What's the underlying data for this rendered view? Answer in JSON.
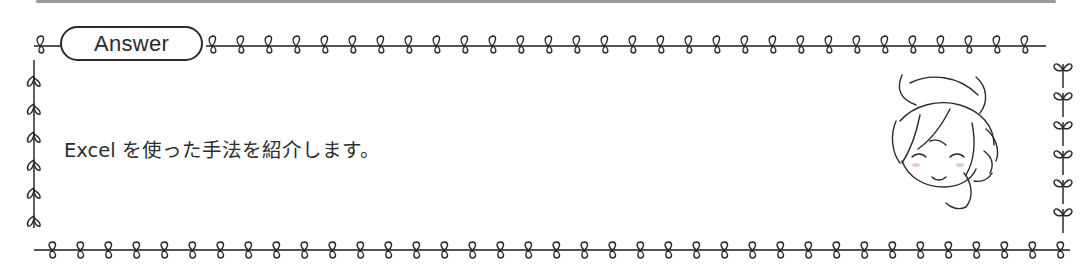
{
  "box": {
    "label": "Answer",
    "text": "Excel を使った手法を紹介します。"
  },
  "decoration": {
    "border_style": "leaf-vine",
    "character_icon": "smiling-chibi-character-icon"
  },
  "colors": {
    "line": "#2b2b2b",
    "top_rule": "#9a9a9a",
    "background": "#ffffff"
  }
}
